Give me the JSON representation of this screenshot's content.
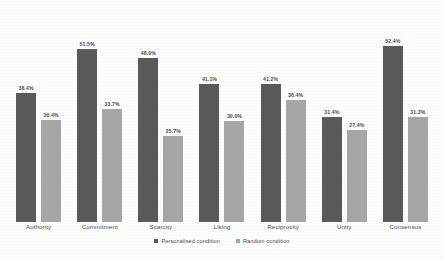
{
  "chart_data": {
    "type": "bar",
    "title": "",
    "subtitle": "",
    "xlabel": "",
    "ylabel": "",
    "ylim": [
      0,
      60
    ],
    "grid": false,
    "legend_position": "bottom-center",
    "categories": [
      "Authority",
      "Commitment",
      "Scarcity",
      "Liking",
      "Reciprocity",
      "Unity",
      "Consensus"
    ],
    "series": [
      {
        "name": "Personalised condition",
        "color": "#595959",
        "values": [
          38.4,
          51.5,
          48.9,
          41.1,
          41.2,
          31.4,
          52.4
        ],
        "labels": [
          "38.4%",
          "51.5%",
          "48.9%",
          "41.1%",
          "41.2%",
          "31.4%",
          "52.4%"
        ]
      },
      {
        "name": "Random condition",
        "color": "#a6a6a6",
        "values": [
          30.4,
          33.7,
          25.7,
          30.0,
          36.4,
          27.4,
          31.3
        ],
        "labels": [
          "30.4%",
          "33.7%",
          "25.7%",
          "30.0%",
          "36.4%",
          "27.4%",
          "31.3%"
        ]
      }
    ]
  },
  "legend": {
    "items": [
      {
        "label": "Personalised condition"
      },
      {
        "label": "Random condition"
      }
    ]
  },
  "colors": {
    "personalised": "#595959",
    "random": "#a6a6a6",
    "background": "#fefefe",
    "text": "#4a4a4a"
  }
}
